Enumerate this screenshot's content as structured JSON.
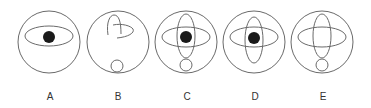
{
  "figure": {
    "type": "multiple-choice-options",
    "options": [
      {
        "label": "A",
        "cx": 49,
        "elements": [
          "outer-circle",
          "horizontal-ellipse",
          "black-dot"
        ]
      },
      {
        "label": "B",
        "cx": 118,
        "elements": [
          "outer-circle",
          "curved-arc",
          "small-circle"
        ]
      },
      {
        "label": "C",
        "cx": 186,
        "elements": [
          "outer-circle",
          "horizontal-ellipse",
          "vertical-ellipse",
          "black-dot",
          "small-circle"
        ]
      },
      {
        "label": "D",
        "cx": 254,
        "elements": [
          "outer-circle",
          "horizontal-ellipse",
          "vertical-ellipse",
          "black-dot"
        ]
      },
      {
        "label": "E",
        "cx": 322,
        "elements": [
          "outer-circle",
          "horizontal-ellipse",
          "vertical-ellipse",
          "small-circle"
        ]
      }
    ],
    "colors": {
      "stroke": "#6a6a6a",
      "dot": "#1a1a1a",
      "label": "#333333"
    }
  }
}
